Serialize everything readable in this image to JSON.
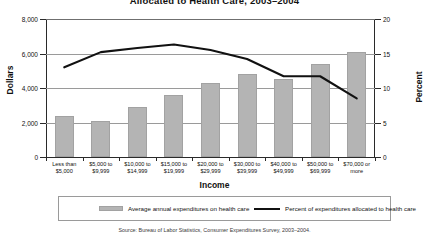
{
  "chart_data": {
    "type": "bar",
    "title": "Allocated to Health Care, 2003–2004",
    "xlabel": "Income",
    "ylabel": "Dollars",
    "y2label": "Percent",
    "ylim": [
      0,
      8000
    ],
    "y2lim": [
      0,
      20
    ],
    "grid": true,
    "legend_position": "bottom",
    "categories": [
      "Less than $5,000",
      "$5,000 to $9,999",
      "$10,000 to $14,999",
      "$15,000 to $19,999",
      "$20,000 to $29,999",
      "$30,000 to $39,999",
      "$40,000 to $49,999",
      "$50,000 to $69,999",
      "$70,000 or more"
    ],
    "categories_lines": [
      [
        "Less than",
        "$5,000"
      ],
      [
        "$5,000 to",
        "$9,999"
      ],
      [
        "$10,000 to",
        "$14,999"
      ],
      [
        "$15,000 to",
        "$19,999"
      ],
      [
        "$20,000 to",
        "$29,999"
      ],
      [
        "$30,000 to",
        "$39,999"
      ],
      [
        "$40,000 to",
        "$49,999"
      ],
      [
        "$50,000 to",
        "$69,999"
      ],
      [
        "$70,000 or",
        "more"
      ]
    ],
    "series": [
      {
        "name": "Average annual expenditures on health care",
        "type": "bar",
        "axis": "left",
        "color": "#b4b4b4",
        "values": [
          2400,
          2100,
          2900,
          3600,
          4300,
          4800,
          4500,
          5400,
          6100
        ]
      },
      {
        "name": "Percent of expenditures allocated to health care",
        "type": "line",
        "axis": "right",
        "color": "#111111",
        "values": [
          13.0,
          15.2,
          15.8,
          16.3,
          15.5,
          14.2,
          11.7,
          11.7,
          8.5
        ]
      }
    ],
    "yticks": [
      "0",
      "2,000",
      "4,000",
      "6,000",
      "8,000"
    ],
    "ytick_values": [
      0,
      2000,
      4000,
      6000,
      8000
    ],
    "y2ticks": [
      "0",
      "5",
      "10",
      "15",
      "20"
    ],
    "y2tick_values": [
      0,
      5,
      10,
      15,
      20
    ],
    "source": "Source: Bureau of Labor Statistics, Consumer Expenditures Survey, 2003–2004."
  },
  "legend": {
    "bar_label": "Average annual expenditures on health care",
    "line_label": "Percent of expenditures allocated to health care"
  }
}
